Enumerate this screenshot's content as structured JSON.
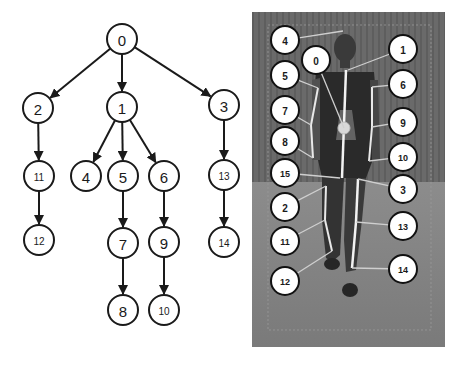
{
  "tree": {
    "title": "Skeleton joint hierarchy",
    "nodes": [
      {
        "id": "0",
        "x": 122,
        "y": 39,
        "size": 15
      },
      {
        "id": "1",
        "x": 122,
        "y": 107,
        "size": 15
      },
      {
        "id": "2",
        "x": 38,
        "y": 108,
        "size": 15
      },
      {
        "id": "3",
        "x": 224,
        "y": 105,
        "size": 15
      },
      {
        "id": "4",
        "x": 86,
        "y": 176,
        "size": 15
      },
      {
        "id": "5",
        "x": 123,
        "y": 176,
        "size": 15
      },
      {
        "id": "6",
        "x": 164,
        "y": 176,
        "size": 15
      },
      {
        "id": "7",
        "x": 123,
        "y": 243,
        "size": 15
      },
      {
        "id": "8",
        "x": 123,
        "y": 310,
        "size": 15
      },
      {
        "id": "9",
        "x": 164,
        "y": 242,
        "size": 15
      },
      {
        "id": "10",
        "x": 164,
        "y": 310,
        "size": 10
      },
      {
        "id": "11",
        "x": 39,
        "y": 176,
        "size": 10
      },
      {
        "id": "12",
        "x": 39,
        "y": 240,
        "size": 10
      },
      {
        "id": "13",
        "x": 224,
        "y": 175,
        "size": 10
      },
      {
        "id": "14",
        "x": 224,
        "y": 242,
        "size": 10
      }
    ],
    "edges": [
      [
        "0",
        "2"
      ],
      [
        "0",
        "1"
      ],
      [
        "0",
        "3"
      ],
      [
        "1",
        "4"
      ],
      [
        "1",
        "5"
      ],
      [
        "1",
        "6"
      ],
      [
        "2",
        "11"
      ],
      [
        "11",
        "12"
      ],
      [
        "5",
        "7"
      ],
      [
        "7",
        "8"
      ],
      [
        "6",
        "9"
      ],
      [
        "9",
        "10"
      ],
      [
        "3",
        "13"
      ],
      [
        "13",
        "14"
      ]
    ],
    "node_radius": 15
  },
  "photo": {
    "description": "Person walking toward camera with skeleton joint overlay",
    "x": 252,
    "y": 12,
    "width": 193,
    "height": 335,
    "background": "#6e6e6e",
    "labels": [
      {
        "id": "4",
        "x": 285,
        "y": 40,
        "tx": 343,
        "ty": 31
      },
      {
        "id": "0",
        "x": 316,
        "y": 60,
        "tx": 344,
        "ty": 128
      },
      {
        "id": "5",
        "x": 285,
        "y": 75,
        "tx": 318,
        "ty": 88
      },
      {
        "id": "7",
        "x": 285,
        "y": 110,
        "tx": 311,
        "ty": 125
      },
      {
        "id": "8",
        "x": 285,
        "y": 141,
        "tx": 313,
        "ty": 158
      },
      {
        "id": "15",
        "x": 285,
        "y": 173,
        "tx": 340,
        "ty": 178
      },
      {
        "id": "2",
        "x": 285,
        "y": 207,
        "tx": 326,
        "ty": 186
      },
      {
        "id": "11",
        "x": 285,
        "y": 241,
        "tx": 325,
        "ty": 220
      },
      {
        "id": "12",
        "x": 285,
        "y": 281,
        "tx": 332,
        "ty": 251
      },
      {
        "id": "1",
        "x": 403,
        "y": 49,
        "tx": 348,
        "ty": 70
      },
      {
        "id": "6",
        "x": 403,
        "y": 84,
        "tx": 372,
        "ty": 87
      },
      {
        "id": "9",
        "x": 403,
        "y": 122,
        "tx": 372,
        "ty": 127
      },
      {
        "id": "10",
        "x": 403,
        "y": 157,
        "tx": 369,
        "ty": 161
      },
      {
        "id": "3",
        "x": 403,
        "y": 189,
        "tx": 358,
        "ty": 179
      },
      {
        "id": "13",
        "x": 403,
        "y": 226,
        "tx": 356,
        "ty": 222
      },
      {
        "id": "14",
        "x": 403,
        "y": 269,
        "tx": 352,
        "ty": 268
      }
    ],
    "label_radius": 14
  }
}
